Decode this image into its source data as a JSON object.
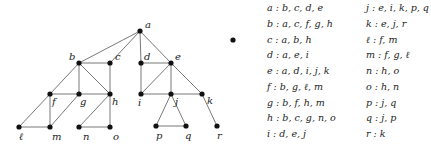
{
  "diagram": {
    "type": "graph",
    "nodes": [
      {
        "id": "a",
        "label": "a",
        "x": 140,
        "y": 31,
        "lx": 5,
        "ly": -3
      },
      {
        "id": "b",
        "label": "b",
        "x": 79,
        "y": 63,
        "lx": -10,
        "ly": -3
      },
      {
        "id": "c",
        "label": "c",
        "x": 110,
        "y": 63,
        "lx": 5,
        "ly": -3
      },
      {
        "id": "d",
        "label": "d",
        "x": 141,
        "y": 63,
        "lx": 3,
        "ly": -3
      },
      {
        "id": "e",
        "label": "e",
        "x": 171,
        "y": 63,
        "lx": 4,
        "ly": -3
      },
      {
        "id": "f",
        "label": "f",
        "x": 50,
        "y": 94,
        "lx": 2,
        "ly": 11
      },
      {
        "id": "g",
        "label": "g",
        "x": 79,
        "y": 94,
        "lx": 1,
        "ly": 11
      },
      {
        "id": "h",
        "label": "h",
        "x": 110,
        "y": 94,
        "lx": 2,
        "ly": 11
      },
      {
        "id": "i",
        "label": "i",
        "x": 141,
        "y": 94,
        "lx": -3,
        "ly": 12
      },
      {
        "id": "j",
        "label": "j",
        "x": 171,
        "y": 94,
        "lx": 4,
        "ly": 11
      },
      {
        "id": "k",
        "label": "k",
        "x": 202,
        "y": 94,
        "lx": 5,
        "ly": 10
      },
      {
        "id": "l",
        "label": "ℓ",
        "x": 19,
        "y": 127,
        "lx": 0,
        "ly": 13
      },
      {
        "id": "m",
        "label": "m",
        "x": 50,
        "y": 127,
        "lx": 2,
        "ly": 13
      },
      {
        "id": "n",
        "label": "n",
        "x": 79,
        "y": 127,
        "lx": 4,
        "ly": 13
      },
      {
        "id": "o",
        "label": "o",
        "x": 110,
        "y": 127,
        "lx": 3,
        "ly": 13
      },
      {
        "id": "p",
        "label": "p",
        "x": 156,
        "y": 126,
        "lx": 0,
        "ly": 13
      },
      {
        "id": "q",
        "label": "q",
        "x": 186,
        "y": 126,
        "lx": -1,
        "ly": 13
      },
      {
        "id": "r",
        "label": "r",
        "x": 217,
        "y": 126,
        "lx": 0,
        "ly": 13
      }
    ],
    "isolated_dot": {
      "x": 233,
      "y": 40
    },
    "edges": [
      [
        "a",
        "b"
      ],
      [
        "a",
        "c"
      ],
      [
        "a",
        "d"
      ],
      [
        "a",
        "e"
      ],
      [
        "b",
        "c"
      ],
      [
        "b",
        "f"
      ],
      [
        "b",
        "g"
      ],
      [
        "b",
        "h"
      ],
      [
        "c",
        "h"
      ],
      [
        "d",
        "e"
      ],
      [
        "d",
        "i"
      ],
      [
        "e",
        "i"
      ],
      [
        "e",
        "j"
      ],
      [
        "e",
        "k"
      ],
      [
        "f",
        "g"
      ],
      [
        "f",
        "l"
      ],
      [
        "f",
        "m"
      ],
      [
        "g",
        "h"
      ],
      [
        "g",
        "m"
      ],
      [
        "h",
        "n"
      ],
      [
        "h",
        "o"
      ],
      [
        "i",
        "j"
      ],
      [
        "j",
        "k"
      ],
      [
        "j",
        "p"
      ],
      [
        "j",
        "q"
      ],
      [
        "k",
        "r"
      ],
      [
        "l",
        "m"
      ],
      [
        "n",
        "o"
      ],
      [
        "p",
        "q"
      ]
    ]
  },
  "adjacency_list": {
    "column1": [
      "a : b, c, d, e",
      "b : a, c, f, g, h",
      "c : a, b, h",
      "d : a, e, i",
      "e : a, d, i, j, k",
      "f : b, g, ℓ, m",
      "g : b, f, h, m",
      "h : b, c, g, n, o",
      "i : d, e, j"
    ],
    "column2": [
      "j : e, i, k, p, q",
      "k : e, j, r",
      "ℓ : f, m",
      "m : f, g, ℓ",
      "n : h, o",
      "o : h, n",
      "p : j, q",
      "q : j, p",
      "r : k"
    ]
  }
}
